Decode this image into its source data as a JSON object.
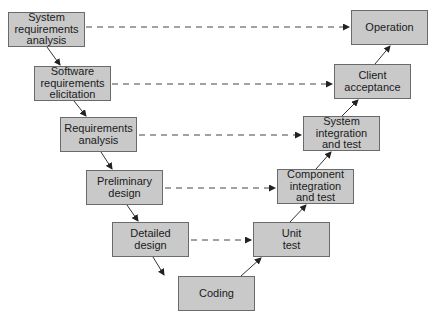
{
  "diagram": {
    "title": "",
    "type": "V-model",
    "left_branch": [
      {
        "id": "sra",
        "label": "System\nrequirements\nanalysis"
      },
      {
        "id": "sre",
        "label": "Software\nrequirements\nelicitation"
      },
      {
        "id": "ra",
        "label": "Requirements\nanalysis"
      },
      {
        "id": "pd",
        "label": "Preliminary\ndesign"
      },
      {
        "id": "dd",
        "label": "Detailed\ndesign"
      }
    ],
    "bottom": {
      "id": "coding",
      "label": "Coding"
    },
    "right_branch": [
      {
        "id": "ut",
        "label": "Unit\ntest"
      },
      {
        "id": "cit",
        "label": "Component\nintegration\nand test"
      },
      {
        "id": "sit",
        "label": "System\nintegration\nand test"
      },
      {
        "id": "ca",
        "label": "Client\nacceptance"
      },
      {
        "id": "op",
        "label": "Operation"
      }
    ],
    "correspondences": [
      [
        "System requirements analysis",
        "Operation"
      ],
      [
        "Software requirements elicitation",
        "Client acceptance"
      ],
      [
        "Requirements analysis",
        "System integration and test"
      ],
      [
        "Preliminary design",
        "Component integration and test"
      ],
      [
        "Detailed design",
        "Unit test"
      ]
    ],
    "colors": {
      "box_fill": "#c9c9c9",
      "box_border": "#6a6a6a",
      "line": "#333333"
    }
  }
}
